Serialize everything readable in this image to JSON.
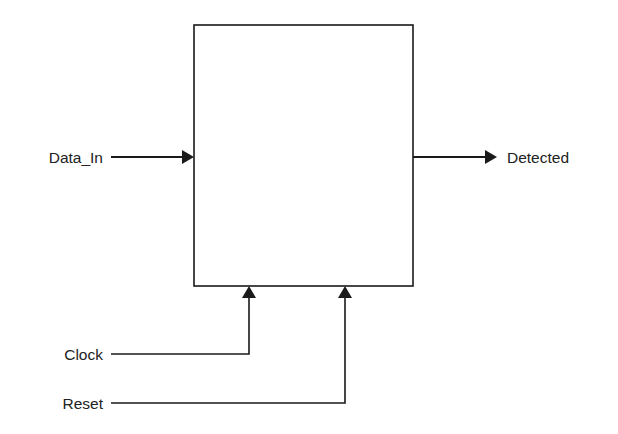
{
  "diagram": {
    "type": "block-diagram",
    "block": {
      "label": ""
    },
    "inputs": [
      {
        "name": "Data_In",
        "side": "left"
      },
      {
        "name": "Clock",
        "side": "bottom"
      },
      {
        "name": "Reset",
        "side": "bottom"
      }
    ],
    "outputs": [
      {
        "name": "Detected",
        "side": "right"
      }
    ],
    "colors": {
      "line": "#1a1a1a",
      "text": "#222222",
      "background": "#ffffff"
    }
  }
}
